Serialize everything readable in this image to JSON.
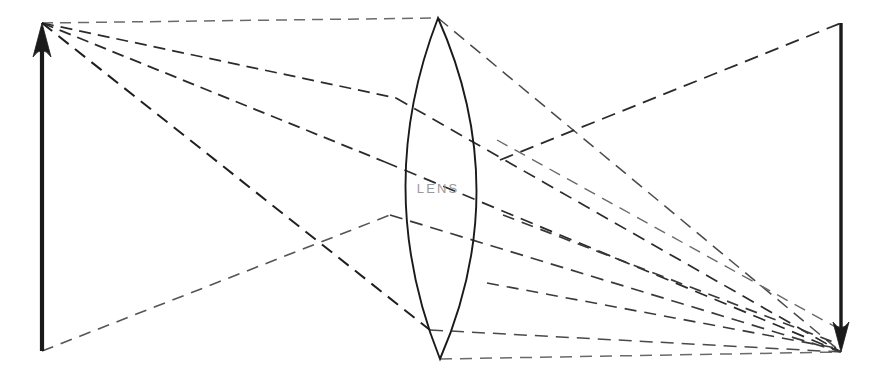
{
  "figure": {
    "width": 876,
    "height": 377,
    "background": "#ffffff"
  },
  "labels": {
    "lens": "LENS"
  },
  "colors": {
    "solid_stroke": "#1a1a1a",
    "ray_stroke": "#2b2b2b",
    "ray_stroke_light": "#555555",
    "label_text": "#9a9a9a",
    "background": "#ffffff"
  },
  "chart_data": {
    "type": "diagram",
    "xlabel": "",
    "ylabel": "",
    "xlim": [
      0,
      876
    ],
    "ylim": [
      0,
      377
    ],
    "grid": false,
    "legend": "none",
    "annotations": [
      {
        "name": "lens-label",
        "text": "LENS",
        "x": 438,
        "y": 190
      }
    ],
    "objects": [
      {
        "name": "object-arrow",
        "kind": "arrow",
        "direction": "up",
        "tail": [
          42,
          351
        ],
        "tip": [
          42,
          23
        ],
        "stroke": "#1a1a1a",
        "stroke_width": 4.2,
        "head_length": 34,
        "head_half_width": 9
      },
      {
        "name": "image-arrow",
        "kind": "arrow",
        "direction": "down",
        "tail": [
          841,
          23
        ],
        "tip": [
          841,
          352
        ],
        "stroke": "#1a1a1a",
        "stroke_width": 3.4,
        "head_length": 30,
        "head_half_width": 8
      },
      {
        "name": "lens-body",
        "kind": "biconvex-lens",
        "top_apex": [
          438,
          18
        ],
        "bottom_apex": [
          440,
          359
        ],
        "left_bulge_x": 384,
        "right_bulge_x": 500,
        "center_y": 189,
        "stroke": "#1a1a1a",
        "stroke_width": 1.9,
        "fill": "none"
      }
    ],
    "rays": [
      {
        "name": "ray-1-incident",
        "group": "object-tip",
        "from": [
          42,
          23
        ],
        "to": [
          438,
          18
        ],
        "dash": "11 7",
        "stroke": "#6a6a6a",
        "stroke_width": 1.5
      },
      {
        "name": "ray-1-refracted",
        "group": "to-image-tip",
        "from": [
          438,
          18
        ],
        "to": [
          841,
          352
        ],
        "dash": "13 8",
        "stroke": "#4a4a4a",
        "stroke_width": 1.5
      },
      {
        "name": "ray-2-incident",
        "group": "object-tip",
        "from": [
          42,
          23
        ],
        "to": [
          396,
          98
        ],
        "dash": "12 7",
        "stroke": "#2b2b2b",
        "stroke_width": 1.7
      },
      {
        "name": "ray-2-refracted",
        "group": "to-image-tip",
        "from": [
          396,
          98
        ],
        "to": [
          841,
          352
        ],
        "dash": "13 8",
        "stroke": "#2b2b2b",
        "stroke_width": 1.7
      },
      {
        "name": "ray-3-incident",
        "group": "object-tip",
        "from": [
          42,
          23
        ],
        "to": [
          385,
          162
        ],
        "dash": "12 7",
        "stroke": "#2b2b2b",
        "stroke_width": 1.8
      },
      {
        "name": "ray-3-refracted",
        "group": "to-image-tip",
        "from": [
          385,
          162
        ],
        "to": [
          841,
          352
        ],
        "dash": "13 8",
        "stroke": "#2b2b2b",
        "stroke_width": 1.7
      },
      {
        "name": "ray-4-incident",
        "group": "object-tip",
        "from": [
          42,
          23
        ],
        "to": [
          430,
          330
        ],
        "dash": "13 8",
        "stroke": "#1f1f1f",
        "stroke_width": 2.0
      },
      {
        "name": "ray-4-refracted",
        "group": "to-image-tip",
        "from": [
          430,
          330
        ],
        "to": [
          841,
          352
        ],
        "dash": "13 8",
        "stroke": "#4a4a4a",
        "stroke_width": 1.5
      },
      {
        "name": "ray-5-incident",
        "group": "object-base",
        "from": [
          42,
          351
        ],
        "to": [
          390,
          215
        ],
        "dash": "12 8",
        "stroke": "#555555",
        "stroke_width": 1.6
      },
      {
        "name": "ray-5-refracted",
        "group": "to-image-tip",
        "from": [
          390,
          215
        ],
        "to": [
          841,
          352
        ],
        "dash": "13 8",
        "stroke": "#3a3a3a",
        "stroke_width": 1.7
      },
      {
        "name": "ray-6-baseline",
        "group": "axis-ray",
        "from": [
          440,
          359
        ],
        "to": [
          841,
          352
        ],
        "dash": "12 8",
        "stroke": "#6a6a6a",
        "stroke_width": 1.5
      },
      {
        "name": "ray-7-exit-upper",
        "group": "to-image-tail",
        "from": [
          500,
          160
        ],
        "to": [
          841,
          23
        ],
        "dash": "14 8",
        "stroke": "#2b2b2b",
        "stroke_width": 1.8
      },
      {
        "name": "ray-8-exit-cross",
        "group": "cross-ray",
        "from": [
          497,
          140
        ],
        "to": [
          841,
          330
        ],
        "dash": "12 8",
        "stroke": "#6a6a6a",
        "stroke_width": 1.4
      },
      {
        "name": "ray-9-exit-lower",
        "group": "cross-ray",
        "from": [
          503,
          215
        ],
        "to": [
          841,
          345
        ],
        "dash": "12 8",
        "stroke": "#3a3a3a",
        "stroke_width": 1.7
      },
      {
        "name": "ray-10-exit-bottom",
        "group": "cross-ray",
        "from": [
          487,
          283
        ],
        "to": [
          841,
          349
        ],
        "dash": "12 8",
        "stroke": "#3a3a3a",
        "stroke_width": 1.6
      }
    ]
  }
}
